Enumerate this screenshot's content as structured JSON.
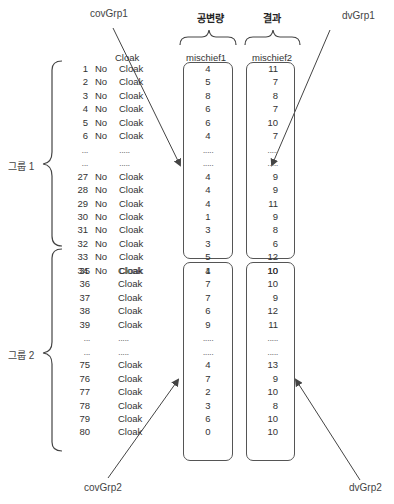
{
  "labels": {
    "cov_grp1": "covGrp1",
    "dv_grp1": "dvGrp1",
    "cov_grp2": "covGrp2",
    "dv_grp2": "dvGrp2",
    "covariate_header": "공변량",
    "outcome_header": "결과",
    "group1": "그룹 1",
    "group2": "그룹 2"
  },
  "columns": {
    "cloak_header": "Cloak",
    "mischief1_header": "mischief1",
    "mischief2_header": "mischief2"
  },
  "group1_rows": [
    {
      "id": "1",
      "no": "No",
      "cloak": "Cloak",
      "mischief1": "4",
      "mischief2": "11"
    },
    {
      "id": "2",
      "no": "No",
      "cloak": "Cloak",
      "mischief1": "5",
      "mischief2": "7"
    },
    {
      "id": "3",
      "no": "No",
      "cloak": "Cloak",
      "mischief1": "8",
      "mischief2": "8"
    },
    {
      "id": "4",
      "no": "No",
      "cloak": "Cloak",
      "mischief1": "6",
      "mischief2": "7"
    },
    {
      "id": "5",
      "no": "No",
      "cloak": "Cloak",
      "mischief1": "6",
      "mischief2": "10"
    },
    {
      "id": "6",
      "no": "No",
      "cloak": "Cloak",
      "mischief1": "4",
      "mischief2": "7"
    },
    {
      "id": "...",
      "no": "",
      "cloak": ".....",
      "mischief1": ".....",
      "mischief2": "....."
    },
    {
      "id": "...",
      "no": "",
      "cloak": ".....",
      "mischief1": ".....",
      "mischief2": "....."
    },
    {
      "id": "27",
      "no": "No",
      "cloak": "Cloak",
      "mischief1": "4",
      "mischief2": "9"
    },
    {
      "id": "28",
      "no": "No",
      "cloak": "Cloak",
      "mischief1": "4",
      "mischief2": "9"
    },
    {
      "id": "29",
      "no": "No",
      "cloak": "Cloak",
      "mischief1": "4",
      "mischief2": "11"
    },
    {
      "id": "30",
      "no": "No",
      "cloak": "Cloak",
      "mischief1": "1",
      "mischief2": "9"
    },
    {
      "id": "31",
      "no": "No",
      "cloak": "Cloak",
      "mischief1": "3",
      "mischief2": "8"
    },
    {
      "id": "32",
      "no": "No",
      "cloak": "Cloak",
      "mischief1": "3",
      "mischief2": "6"
    },
    {
      "id": "33",
      "no": "No",
      "cloak": "Cloak",
      "mischief1": "5",
      "mischief2": "12"
    },
    {
      "id": "34",
      "no": "No",
      "cloak": "Cloak",
      "mischief1": "4",
      "mischief2": "10"
    }
  ],
  "group2_rows": [
    {
      "id": "35",
      "no": "",
      "cloak": "Cloak",
      "mischief1": "1",
      "mischief2": "10"
    },
    {
      "id": "36",
      "no": "",
      "cloak": "Cloak",
      "mischief1": "7",
      "mischief2": "10"
    },
    {
      "id": "37",
      "no": "",
      "cloak": "Cloak",
      "mischief1": "7",
      "mischief2": "9"
    },
    {
      "id": "38",
      "no": "",
      "cloak": "Cloak",
      "mischief1": "6",
      "mischief2": "12"
    },
    {
      "id": "39",
      "no": "",
      "cloak": "Cloak",
      "mischief1": "9",
      "mischief2": "11"
    },
    {
      "id": "...",
      "no": "",
      "cloak": ".....",
      "mischief1": ".....",
      "mischief2": "....."
    },
    {
      "id": "...",
      "no": "",
      "cloak": ".....",
      "mischief1": ".....",
      "mischief2": "....."
    },
    {
      "id": "75",
      "no": "",
      "cloak": "Cloak",
      "mischief1": "4",
      "mischief2": "13"
    },
    {
      "id": "76",
      "no": "",
      "cloak": "Cloak",
      "mischief1": "7",
      "mischief2": "9"
    },
    {
      "id": "77",
      "no": "",
      "cloak": "Cloak",
      "mischief1": "2",
      "mischief2": "10"
    },
    {
      "id": "78",
      "no": "",
      "cloak": "Cloak",
      "mischief1": "3",
      "mischief2": "8"
    },
    {
      "id": "79",
      "no": "",
      "cloak": "Cloak",
      "mischief1": "6",
      "mischief2": "10"
    },
    {
      "id": "80",
      "no": "",
      "cloak": "Cloak",
      "mischief1": "0",
      "mischief2": "10"
    }
  ],
  "colors": {
    "line": "#555555",
    "text": "#333333"
  }
}
